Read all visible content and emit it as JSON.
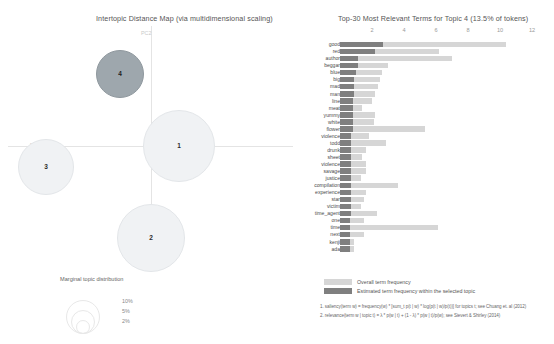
{
  "left": {
    "title": "Intertopic Distance Map (via multidimensional scaling)",
    "axis_labels": {
      "x": "PC1",
      "y": "PC2"
    },
    "topics": [
      {
        "id": "1",
        "label": "1",
        "cx": 171,
        "cy": 120,
        "r": 36,
        "selected": false
      },
      {
        "id": "2",
        "label": "2",
        "cx": 143,
        "cy": 212,
        "r": 34,
        "selected": false
      },
      {
        "id": "3",
        "label": "3",
        "cx": 38,
        "cy": 141,
        "r": 28,
        "selected": false
      },
      {
        "id": "4",
        "label": "4",
        "cx": 112,
        "cy": 48,
        "r": 24,
        "selected": true
      }
    ],
    "marginal_legend": {
      "title": "Marginal topic distribution",
      "items": [
        {
          "pct": "2%",
          "r": 6
        },
        {
          "pct": "5%",
          "r": 11
        },
        {
          "pct": "10%",
          "r": 16
        }
      ]
    }
  },
  "right": {
    "title": "Top-30 Most Relevant Terms for Topic 4 (13.5% of tokens)",
    "axis": {
      "ticks": [
        2,
        4,
        6,
        8,
        10,
        12
      ],
      "max": 13.0,
      "min": 0
    },
    "legend": [
      {
        "swatch": "#d6d6d6",
        "text": "Overall term frequency"
      },
      {
        "swatch": "#7f7f7f",
        "text": "Estimated term frequency within the selected topic"
      }
    ],
    "footnotes": [
      "1. saliency(term w) = frequency(w) * [sum_t p(t | w) * log(p(t | w)/p(t))] for topics t; see Chuang et. al (2012)",
      "2. relevance(term w | topic t) = λ * p(w | t) + (1 - λ) * p(w | t)/p(w); see Sievert & Shirley (2014)"
    ],
    "colors": {
      "overall": "#d6d6d6",
      "topic": "#7f7f7f",
      "selected_circle": "#9ea7ad",
      "unselected_circle": "#f0f2f4"
    }
  },
  "chart_data": {
    "type": "bar",
    "title": "Top-30 Most Relevant Terms for Topic 4 (13.5% of tokens)",
    "xlabel": "",
    "ylabel": "",
    "xlim": [
      0,
      13.0
    ],
    "ticks": [
      2,
      4,
      6,
      8,
      10,
      12
    ],
    "grid": true,
    "legend_position": "bottom",
    "orientation": "horizontal",
    "categories": [
      "good",
      "red",
      "author",
      "beggar",
      "blue",
      "big",
      "mad",
      "man",
      "line",
      "meat",
      "yummy",
      "white",
      "flower",
      "violence",
      "todd",
      "drunk",
      "sheet",
      "violence",
      "savage",
      "justice",
      "compilation",
      "experience",
      "star",
      "victim",
      "time_agent",
      "one",
      "time",
      "next",
      "kenji",
      "ada"
    ],
    "series": [
      {
        "name": "Overall term frequency",
        "values": [
          10.4,
          6.2,
          7.0,
          3.0,
          2.6,
          2.5,
          2.4,
          2.2,
          2.0,
          1.4,
          2.2,
          2.1,
          5.3,
          1.8,
          2.9,
          1.6,
          1.4,
          1.6,
          1.6,
          1.3,
          3.6,
          1.6,
          1.5,
          1.3,
          2.3,
          1.5,
          6.1,
          1.5,
          0.9,
          0.9
        ]
      },
      {
        "name": "Estimated term frequency within the selected topic",
        "values": [
          2.7,
          2.2,
          1.1,
          1.1,
          1.0,
          0.9,
          0.9,
          0.9,
          0.8,
          0.8,
          0.8,
          0.8,
          0.8,
          0.7,
          0.7,
          0.7,
          0.7,
          0.7,
          0.7,
          0.7,
          0.7,
          0.7,
          0.7,
          0.7,
          0.7,
          0.6,
          0.6,
          0.6,
          0.6,
          0.6
        ]
      }
    ]
  }
}
